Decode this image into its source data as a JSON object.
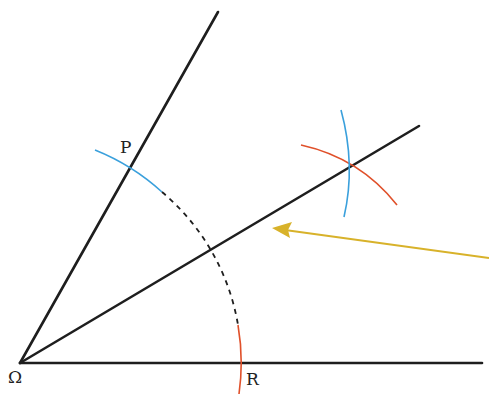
{
  "diagram": {
    "labels": {
      "vertex": "Ω",
      "point_p": "P",
      "point_r": "R"
    },
    "colors": {
      "line": "#1e1e1e",
      "arc_blue": "#3aa0dc",
      "arc_red": "#e0502a",
      "arrow": "#d8b22a"
    },
    "points": {
      "omega": [
        20,
        363
      ],
      "p": [
        131,
        168
      ],
      "r": [
        241,
        363
      ],
      "bisector_intersection": [
        349,
        169
      ]
    },
    "elements": [
      "ray Ω→upper (through P)",
      "ray Ω→horizontal (through R)",
      "angle bisector ray",
      "blue arc at P",
      "red arc at R",
      "dashed arc between P and R",
      "blue construction arc",
      "red construction arc",
      "yellow arrow pointing to bisector"
    ]
  }
}
